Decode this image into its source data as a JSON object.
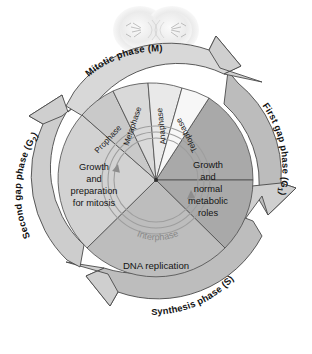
{
  "figure": {
    "micrograph_alt": "dividing-cell-micrograph"
  },
  "ring": {
    "labels": [
      {
        "id": "mitotic",
        "text": "Mitotic phase (M)",
        "sub": ""
      },
      {
        "id": "g1",
        "text": "First gap phase (G",
        "sub": "1",
        "close": ")"
      },
      {
        "id": "s",
        "text": "Synthesis phase (S)",
        "sub": ""
      },
      {
        "id": "g2",
        "text": "Second gap phase (G",
        "sub": "2",
        "close": ")"
      }
    ]
  },
  "subphases": [
    {
      "id": "prophase",
      "label": "Prophase"
    },
    {
      "id": "metaphase",
      "label": "Metaphase"
    },
    {
      "id": "anaphase",
      "label": "Anaphase"
    },
    {
      "id": "telophase",
      "label": "Telophase"
    }
  ],
  "wedge_text": {
    "g1_line1": "Growth",
    "g1_line2": "and",
    "g1_line3": "normal",
    "g1_line4": "metabolic",
    "g1_line5": "roles",
    "g2_line1": "Growth",
    "g2_line2": "and",
    "g2_line3": "preparation",
    "g2_line4": "for mitosis",
    "s_label": "DNA replication"
  },
  "inner": {
    "interphase_label": "Interphase"
  },
  "caption": {
    "text": ""
  },
  "colors": {
    "g1_wedge": "#a9a9a9",
    "s_wedge": "#bdbdbd",
    "g2_wedge": "#d2d2d2",
    "prophase": "#c9c9c9",
    "metaphase": "#d9d9d9",
    "anaphase": "#e8e8e8",
    "telophase": "#f6f6f6",
    "ring_band": "#c4c4c4",
    "ring_band_light": "#dcdcdc",
    "arrow": "#cfcfcf",
    "outline": "#4a4a4a",
    "inner_ring": "#b0b0b0"
  }
}
